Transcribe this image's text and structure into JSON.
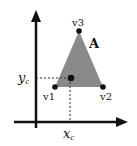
{
  "diagram": {
    "type": "triangle-centroid",
    "triangle_label": "A",
    "vertices": [
      {
        "id": "v1",
        "label": "v1",
        "x": 55,
        "y": 87
      },
      {
        "id": "v2",
        "label": "v2",
        "x": 103,
        "y": 87
      },
      {
        "id": "v3",
        "label": "v3",
        "x": 79,
        "y": 31
      }
    ],
    "centroid": {
      "x": 71,
      "y": 78,
      "x_label": "x",
      "x_sub": "c",
      "y_label": "y",
      "y_sub": "c"
    },
    "colors": {
      "fill": "#8a8a8a",
      "axis": "#111111",
      "dash": "#333333"
    }
  }
}
